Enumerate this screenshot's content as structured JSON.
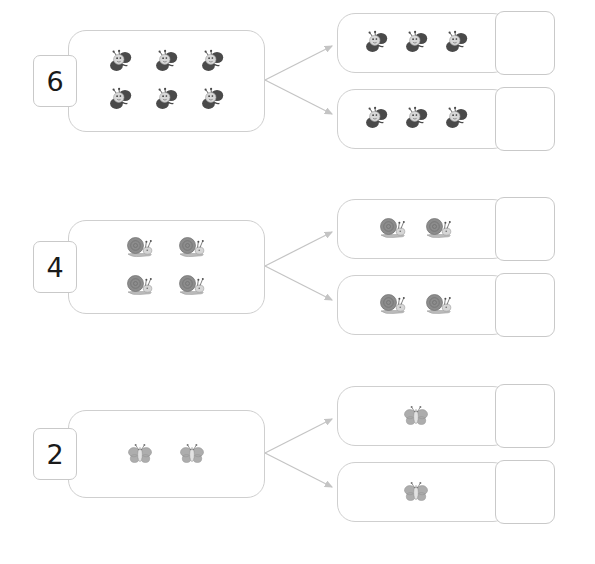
{
  "page": {
    "background_color": "#ffffff",
    "width": 595,
    "height": 564
  },
  "style": {
    "outline_color": "#cfcfcf",
    "chip_outline_color": "#c9c9c9",
    "number_color": "#1a1a1a",
    "arrow_color": "#c4c4c4",
    "bee_dark": "#4a4a4a",
    "bee_light": "#d8d8d8",
    "snail_shell": "#8c8c8c",
    "snail_body": "#bdbdbd",
    "butterfly_wing": "#adadad",
    "butterfly_body": "#e2e2e2"
  },
  "rows": [
    {
      "id": "row-1",
      "number_label": "6",
      "total_count": 6,
      "icon": "bee-icon",
      "icon_name": "bee",
      "source_columns": 3,
      "source_rows": 2,
      "parts": [
        {
          "count": 3,
          "answer_value": ""
        },
        {
          "count": 3,
          "answer_value": ""
        }
      ]
    },
    {
      "id": "row-2",
      "number_label": "4",
      "total_count": 4,
      "icon": "snail-icon",
      "icon_name": "snail",
      "source_columns": 2,
      "source_rows": 2,
      "parts": [
        {
          "count": 2,
          "answer_value": ""
        },
        {
          "count": 2,
          "answer_value": ""
        }
      ]
    },
    {
      "id": "row-3",
      "number_label": "2",
      "total_count": 2,
      "icon": "butterfly-icon",
      "icon_name": "butterfly",
      "source_columns": 2,
      "source_rows": 1,
      "parts": [
        {
          "count": 1,
          "answer_value": ""
        },
        {
          "count": 1,
          "answer_value": ""
        }
      ]
    }
  ]
}
